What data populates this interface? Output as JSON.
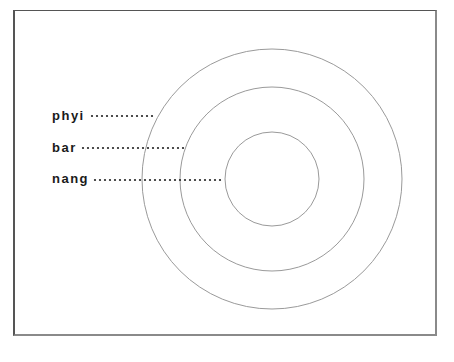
{
  "diagram": {
    "type": "concentric-circles",
    "center": [
      272,
      179
    ],
    "circles": [
      {
        "name": "outer",
        "radius": 130
      },
      {
        "name": "middle",
        "radius": 92
      },
      {
        "name": "inner",
        "radius": 47
      }
    ],
    "labels": [
      {
        "text": "phyi",
        "x": 52,
        "y": 109,
        "leader_start": 92,
        "leader_end": 152,
        "leader_y": 116,
        "target": "outer"
      },
      {
        "text": "bar",
        "x": 52,
        "y": 141,
        "leader_start": 83,
        "leader_end": 187,
        "leader_y": 148,
        "target": "middle"
      },
      {
        "text": "nang",
        "x": 52,
        "y": 172,
        "leader_start": 95,
        "leader_end": 222,
        "leader_y": 180,
        "target": "inner"
      }
    ],
    "colors": {
      "circle_stroke": "#9a9a9a",
      "leader_dots": "#222222",
      "label_text": "#1a1a1a"
    }
  }
}
